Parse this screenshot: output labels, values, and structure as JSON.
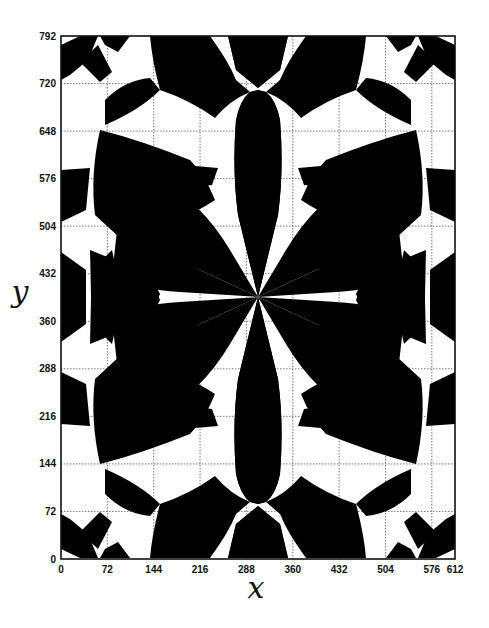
{
  "chart_data": {
    "type": "heatmap",
    "title": "",
    "xlabel": "x",
    "ylabel": "y",
    "xlim": [
      0,
      612
    ],
    "ylim": [
      0,
      792
    ],
    "x_ticks": [
      0,
      72,
      144,
      216,
      288,
      360,
      432,
      504,
      576,
      612
    ],
    "y_ticks": [
      0,
      72,
      144,
      216,
      288,
      360,
      432,
      504,
      576,
      648,
      720,
      792
    ],
    "grid": true,
    "grid_style": "dotted",
    "colors": {
      "fill": "#000000",
      "background": "#ffffff"
    },
    "center": [
      306,
      396
    ]
  },
  "axes": {
    "x_label": "x",
    "y_label": "y",
    "x_tick_labels": [
      "0",
      "72",
      "144",
      "216",
      "288",
      "360",
      "432",
      "504",
      "576",
      "612"
    ],
    "y_tick_labels": [
      "0",
      "72",
      "144",
      "216",
      "288",
      "360",
      "432",
      "504",
      "576",
      "648",
      "720",
      "792"
    ]
  }
}
